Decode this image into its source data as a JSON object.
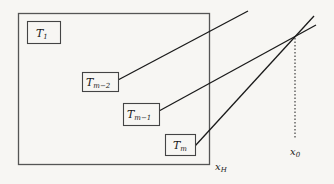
{
  "diagram": {
    "outer_box_label": "x_H",
    "boxes": [
      {
        "id": "T1",
        "main": "T",
        "sub": "1"
      },
      {
        "id": "Tm-2",
        "main": "T",
        "sub": "m−2"
      },
      {
        "id": "Tm-1",
        "main": "T",
        "sub": "m−1"
      },
      {
        "id": "Tm",
        "main": "T",
        "sub": "m"
      }
    ],
    "x_h_label": {
      "main": "x",
      "sub": "H"
    },
    "x0_label": {
      "main": "x",
      "sub": "0"
    },
    "colors": {
      "stroke": "#1a1a1a",
      "box_stroke": "#555555",
      "background": "#f7f6f3"
    }
  }
}
